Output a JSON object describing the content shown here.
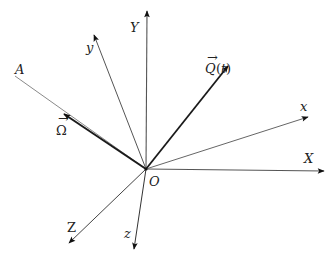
{
  "diagram": {
    "title": "",
    "origin": {
      "label": "O",
      "x": 146,
      "y": 169
    },
    "axes": [
      {
        "id": "X",
        "label": "X",
        "tip": [
          324,
          171
        ],
        "label_pos": [
          304,
          163
        ],
        "stroke": "#444",
        "width": 1.1,
        "arrow": true
      },
      {
        "id": "Y",
        "label": "Y",
        "tip": [
          147,
          11
        ],
        "label_pos": [
          131,
          32
        ],
        "stroke": "#444",
        "width": 1.1,
        "arrow": true
      },
      {
        "id": "Z",
        "label": "Z",
        "tip": [
          69,
          243
        ],
        "label_pos": [
          67,
          231
        ],
        "stroke": "#444",
        "width": 1.0,
        "arrow": true
      },
      {
        "id": "x",
        "label": "x",
        "tip": [
          308,
          117
        ],
        "label_pos": [
          301,
          110
        ],
        "stroke": "#555",
        "width": 1.0,
        "arrow": true
      },
      {
        "id": "y",
        "label": "y",
        "tip": [
          94,
          35
        ],
        "label_pos": [
          86,
          52
        ],
        "stroke": "#555",
        "width": 1.0,
        "arrow": true
      },
      {
        "id": "z",
        "label": "z",
        "tip": [
          134,
          249
        ],
        "label_pos": [
          124,
          237
        ],
        "stroke": "#333",
        "width": 1.0,
        "arrow": true
      }
    ],
    "lines": [
      {
        "id": "A",
        "label": "A",
        "end": [
          15,
          76
        ],
        "label_pos": [
          15,
          73
        ],
        "stroke": "#888",
        "width": 1.0
      }
    ],
    "vectors": [
      {
        "id": "Omega",
        "label": "Ω",
        "has_vector_arrow": true,
        "tip": [
          64,
          114
        ],
        "label_pos": [
          56,
          134
        ],
        "stroke": "#222",
        "width": 2.0
      },
      {
        "id": "Q",
        "label": "Q(t)",
        "has_vector_arrow": true,
        "tip": [
          228,
          66
        ],
        "label_pos": [
          205,
          73
        ],
        "stroke": "#222",
        "width": 1.8
      }
    ]
  },
  "labels": {
    "origin": "O",
    "X": "X",
    "Y": "Y",
    "Z": "Z",
    "x": "x",
    "y": "y",
    "z": "z",
    "A": "A",
    "omega": "Ω",
    "omega_arrow": "→",
    "q": "Q",
    "q_paren_open": "(",
    "q_t": "t",
    "q_paren_close": ")",
    "q_arrow": "→"
  }
}
